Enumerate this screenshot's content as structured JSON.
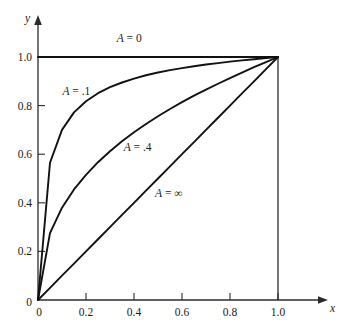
{
  "chart_data": {
    "type": "line",
    "title": "",
    "xlabel": "x",
    "ylabel": "y",
    "xlim": [
      0,
      1.0
    ],
    "ylim": [
      0,
      1.0
    ],
    "grid": false,
    "legend_position": "inline-annotations",
    "xticks": [
      "0",
      "0.2",
      "0.4",
      "0.6",
      "0.8",
      "1.0"
    ],
    "xtick_values": [
      0,
      0.2,
      0.4,
      0.6,
      0.8,
      1.0
    ],
    "yticks": [
      "0",
      "0.2",
      "0.4",
      "0.6",
      "0.8",
      "1.0"
    ],
    "ytick_values": [
      0,
      0.2,
      0.4,
      0.6,
      0.8,
      1.0
    ],
    "x": [
      0,
      0.05,
      0.1,
      0.15,
      0.2,
      0.25,
      0.3,
      0.35,
      0.4,
      0.45,
      0.5,
      0.55,
      0.6,
      0.65,
      0.7,
      0.75,
      0.8,
      0.85,
      0.9,
      0.95,
      1.0
    ],
    "series": [
      {
        "name": "A = 0",
        "label": "A = 0",
        "label_x": 0.38,
        "label_y": 1.06,
        "values": [
          1.0,
          1.0,
          1.0,
          1.0,
          1.0,
          1.0,
          1.0,
          1.0,
          1.0,
          1.0,
          1.0,
          1.0,
          1.0,
          1.0,
          1.0,
          1.0,
          1.0,
          1.0,
          1.0,
          1.0,
          1.0
        ]
      },
      {
        "name": "A = .1",
        "label": "A = .1",
        "label_x": 0.16,
        "label_y": 0.845,
        "values": [
          0,
          0.565,
          0.7,
          0.772,
          0.818,
          0.851,
          0.876,
          0.895,
          0.911,
          0.925,
          0.936,
          0.946,
          0.954,
          0.962,
          0.969,
          0.975,
          0.981,
          0.986,
          0.991,
          0.996,
          1.0
        ]
      },
      {
        "name": "A = .4",
        "label": "A = .4",
        "label_x": 0.415,
        "label_y": 0.615,
        "values": [
          0,
          0.275,
          0.38,
          0.455,
          0.515,
          0.567,
          0.612,
          0.653,
          0.69,
          0.724,
          0.756,
          0.786,
          0.814,
          0.841,
          0.866,
          0.89,
          0.913,
          0.936,
          0.958,
          0.979,
          1.0
        ]
      },
      {
        "name": "A = infinity",
        "label": "A = ∞",
        "label_x": 0.545,
        "label_y": 0.425,
        "values": [
          0,
          0.05,
          0.1,
          0.15,
          0.2,
          0.25,
          0.3,
          0.35,
          0.4,
          0.45,
          0.5,
          0.55,
          0.6,
          0.65,
          0.7,
          0.75,
          0.8,
          0.85,
          0.9,
          0.95,
          1.0
        ]
      }
    ],
    "colors": {
      "curve": "#111111",
      "axis": "#2b2b2b",
      "background": "#ffffff",
      "text": "#1a1a1a"
    }
  }
}
